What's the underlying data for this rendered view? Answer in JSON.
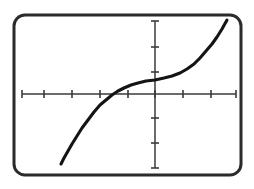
{
  "figure": {
    "kind": "graphing-calculator-screen",
    "caption": "",
    "background_color": "#ffffff",
    "ink_color": "#1a1a1a",
    "border": {
      "name": "calculator-screen-bezel",
      "color": "#2b2b2b",
      "corner_radius": 11,
      "stroke_width": 3,
      "x": 14,
      "y": 15,
      "width": 227,
      "height": 160
    }
  },
  "chart_data": {
    "type": "line",
    "title": "",
    "subtitle": "",
    "xlabel": "",
    "ylabel": "",
    "grid": false,
    "legend": null,
    "legend_position": "none",
    "annotations": [],
    "axes": {
      "x_axis": {
        "name": "x-axis",
        "visible": true,
        "pixel_y": 94,
        "pixel_x_start": 22,
        "pixel_x_end": 236,
        "tick_labels": [],
        "tick_values": [
          -5,
          -4,
          -3,
          -2,
          -1,
          0,
          1,
          2,
          3
        ],
        "tick_pixels": [
          22,
          44,
          72,
          100,
          128,
          155,
          183,
          211,
          236
        ],
        "tick_length": 8,
        "arrow": false
      },
      "y_axis": {
        "name": "y-axis",
        "visible": true,
        "pixel_x": 155,
        "pixel_y_start": 21,
        "pixel_y_end": 168,
        "tick_labels": [],
        "tick_values": [
          3,
          2,
          1,
          0,
          -1,
          -2,
          -3
        ],
        "tick_pixels": [
          21,
          47,
          72,
          94,
          118,
          143,
          168
        ],
        "tick_length": 8,
        "arrow": false
      },
      "xlim": [
        -5.0,
        3.0
      ],
      "ylim": [
        -3.0,
        3.0
      ]
    },
    "series": [
      {
        "name": "cubic-curve",
        "color": "#141414",
        "line_width": 3.1,
        "style": "solid",
        "description": "increasing odd cubic-like curve with flat inflection plateau just left of the y-axis; rises steeply at both ends",
        "x_intercepts": [
          -1.0
        ],
        "y_intercept": 0.35,
        "pixel_points": [
          [
            61,
            164
          ],
          [
            64,
            158
          ],
          [
            68,
            151
          ],
          [
            72,
            144
          ],
          [
            77,
            136
          ],
          [
            82,
            128
          ],
          [
            88,
            120
          ],
          [
            94,
            112
          ],
          [
            100,
            105
          ],
          [
            106,
            100
          ],
          [
            112,
            95
          ],
          [
            118,
            91
          ],
          [
            124,
            88
          ],
          [
            131,
            85
          ],
          [
            138,
            83
          ],
          [
            146,
            81
          ],
          [
            155,
            80
          ],
          [
            164,
            78
          ],
          [
            172,
            76
          ],
          [
            180,
            73
          ],
          [
            187,
            69
          ],
          [
            194,
            64
          ],
          [
            200,
            58
          ],
          [
            206,
            51
          ],
          [
            212,
            44
          ],
          [
            217,
            37
          ],
          [
            222,
            29
          ],
          [
            227,
            20
          ]
        ],
        "values_xy": [
          [
            -3.5,
            -2.85
          ],
          [
            -3.3,
            -2.6
          ],
          [
            -3.15,
            -2.3
          ],
          [
            -3.0,
            -2.05
          ],
          [
            -2.8,
            -1.7
          ],
          [
            -2.65,
            -1.38
          ],
          [
            -2.45,
            -1.05
          ],
          [
            -2.2,
            -0.73
          ],
          [
            -2.0,
            -0.45
          ],
          [
            -1.8,
            -0.25
          ],
          [
            -1.55,
            -0.04
          ],
          [
            -1.35,
            0.12
          ],
          [
            -1.12,
            0.24
          ],
          [
            -0.88,
            0.36
          ],
          [
            -0.6,
            0.44
          ],
          [
            -0.32,
            0.52
          ],
          [
            0.0,
            0.56
          ],
          [
            0.32,
            0.64
          ],
          [
            0.62,
            0.72
          ],
          [
            0.9,
            0.84
          ],
          [
            1.15,
            1.0
          ],
          [
            1.4,
            1.2
          ],
          [
            1.62,
            1.45
          ],
          [
            1.85,
            1.72
          ],
          [
            2.05,
            2.0
          ],
          [
            2.22,
            2.3
          ],
          [
            2.4,
            2.6
          ],
          [
            2.6,
            2.97
          ]
        ]
      }
    ]
  }
}
